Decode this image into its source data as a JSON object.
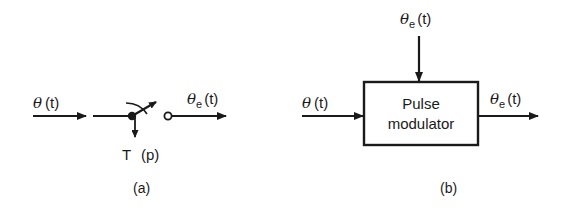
{
  "panels": {
    "a": {
      "caption": "(a)",
      "input_label_symbol": "θ",
      "input_label_arg": "(t)",
      "output_label_symbol": "θ",
      "output_label_sub": "e",
      "output_label_arg": "(t)",
      "sampler_period_label": "T",
      "sampler_pulse_label": "(p)"
    },
    "b": {
      "caption": "(b)",
      "block_line1": "Pulse",
      "block_line2": "modulator",
      "input_label_symbol": "θ",
      "input_label_arg": "(t)",
      "top_input_label_symbol": "θ",
      "top_input_label_sub": "e",
      "top_input_label_arg": "(t)",
      "output_label_symbol": "θ",
      "output_label_sub": "e",
      "output_label_arg": "(t)"
    }
  },
  "colors": {
    "stroke": "#1a1a1a",
    "background": "#ffffff"
  }
}
